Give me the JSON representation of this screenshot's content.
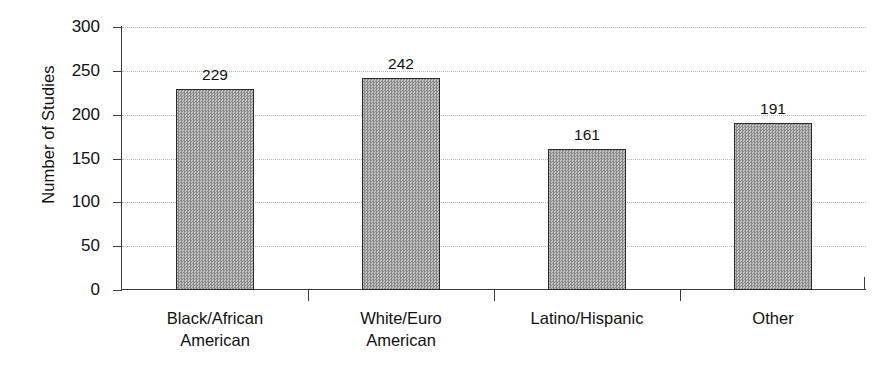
{
  "chart_data": {
    "type": "bar",
    "title": "",
    "xlabel": "",
    "ylabel": "Number of Studies",
    "categories": [
      "Black/African American",
      "White/Euro American",
      "Latino/Hispanic",
      "Other"
    ],
    "category_lines": [
      [
        "Black/African",
        "American"
      ],
      [
        "White/Euro",
        "American"
      ],
      [
        "Latino/Hispanic",
        ""
      ],
      [
        "Other",
        ""
      ]
    ],
    "values": [
      229,
      242,
      161,
      191
    ],
    "value_labels": [
      "229",
      "242",
      "161",
      "191"
    ],
    "ylim": [
      0,
      300
    ],
    "yticks": [
      0,
      50,
      100,
      150,
      200,
      250,
      300
    ],
    "ytick_labels": [
      "0",
      "50",
      "100",
      "150",
      "200",
      "250",
      "300"
    ],
    "grid": "horizontal-dotted",
    "legend": "none",
    "bar_fill_color": "#9a9a9a",
    "bar_border_color": "#2b2b2b",
    "gridline_color": "#b6b6b6",
    "axis_color": "#3b3b3b",
    "background_color": "#ffffff",
    "text_color": "#111111"
  }
}
